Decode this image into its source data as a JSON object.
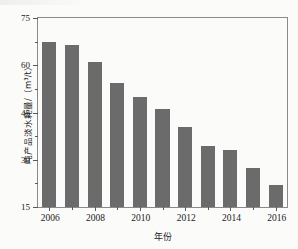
{
  "chart_data": {
    "type": "bar",
    "title": "",
    "xlabel": "年份",
    "ylabel": "吨产品淡水耗量/（m³/t）",
    "categories": [
      "2006",
      "2007",
      "2008",
      "2009",
      "2010",
      "2011",
      "2012",
      "2013",
      "2014",
      "2015",
      "2016"
    ],
    "values": [
      67.5,
      66.5,
      61.0,
      54.5,
      50.0,
      46.0,
      40.5,
      34.5,
      33.0,
      27.5,
      22.0
    ],
    "ylim": [
      15,
      75
    ],
    "yticks": [
      15,
      30,
      45,
      60,
      75
    ],
    "ytick_labels": [
      "15",
      "30",
      "45",
      "60",
      "75"
    ],
    "xtick_labels": [
      "2006",
      "2008",
      "2010",
      "2012",
      "2014",
      "2016"
    ],
    "xtick_categories": [
      "2006",
      "2008",
      "2010",
      "2012",
      "2014",
      "2016"
    ],
    "grid": false,
    "legend": null,
    "bar_color": "#6b6b6b",
    "axis_color": "#8a8a8a",
    "minor_ticks": true
  }
}
